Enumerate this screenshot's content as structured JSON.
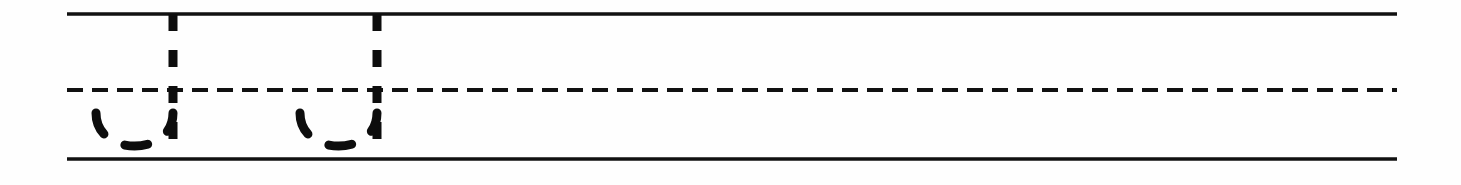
{
  "worksheet": {
    "title": "Handwriting Practice Row",
    "description": "Ruled penmanship row with dotted tracing guides",
    "background_color": "#fefefe",
    "ink_color": "#111111",
    "width": 1461,
    "height": 185
  },
  "rules": {
    "left_x": 67,
    "right_x": 1397,
    "items": [
      {
        "name": "top-line",
        "label": "Top line",
        "style": "solid",
        "y": 14,
        "thickness": 3.4,
        "color": "#111111"
      },
      {
        "name": "midline",
        "label": "Dashed midline",
        "style": "dashed",
        "y": 90,
        "thickness": 4.2,
        "color": "#111111",
        "dash_pattern": "16 9"
      },
      {
        "name": "baseline",
        "label": "Baseline",
        "style": "solid",
        "y": 159,
        "thickness": 3.4,
        "color": "#111111"
      }
    ]
  },
  "tracing": {
    "letter": "u",
    "count": 2,
    "stroke_width": 9,
    "stem_dash_pattern": "17 19",
    "bowl_dash_pattern": "23 24",
    "glyphs": [
      {
        "name": "trace-letter-u-1",
        "label": "u",
        "index": 1,
        "stem_x": 173,
        "stem_top_y": 14,
        "stem_bottom_y": 140,
        "bowl_left_x": 96,
        "bowl_right_x": 173,
        "bowl_top_y": 113,
        "bowl_bottom_y": 157
      },
      {
        "name": "trace-letter-u-2",
        "label": "u",
        "index": 2,
        "stem_x": 377,
        "stem_top_y": 14,
        "stem_bottom_y": 140,
        "bowl_left_x": 300,
        "bowl_right_x": 377,
        "bowl_top_y": 113,
        "bowl_bottom_y": 157
      }
    ]
  }
}
